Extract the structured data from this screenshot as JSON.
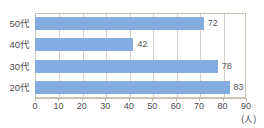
{
  "chart_data": {
    "type": "bar",
    "orientation": "horizontal",
    "title": "",
    "subtitle": "",
    "xlabel": "",
    "ylabel": "",
    "unit_label": "(人)",
    "categories": [
      "50代",
      "40代",
      "30代",
      "20代"
    ],
    "values": [
      72,
      42,
      78,
      83
    ],
    "series": [
      {
        "name": "",
        "values": [
          72,
          42,
          78,
          83
        ]
      }
    ],
    "data_labels": [
      "72",
      "42",
      "78",
      "83"
    ],
    "xlim": [
      0,
      90
    ],
    "ylim": null,
    "x_ticks": [
      0,
      10,
      20,
      30,
      40,
      50,
      60,
      70,
      80,
      90
    ],
    "x_tick_labels": [
      "0",
      "10",
      "20",
      "30",
      "40",
      "50",
      "60",
      "70",
      "80",
      "90"
    ],
    "grid": "vertical",
    "legend": "none",
    "legend_position": "",
    "bar_color": "#85ace0",
    "grid_color": "#d6d1c6",
    "frame_color": "#c9c3b6",
    "text_color": "#4b4b4d",
    "background": "#ffffff"
  }
}
